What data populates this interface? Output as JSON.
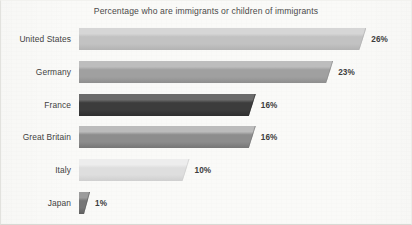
{
  "chart_data": {
    "type": "bar",
    "orientation": "horizontal",
    "title": "Percentage who are immigrants or children of immigrants",
    "xlabel": "",
    "ylabel": "",
    "xlim": [
      0,
      26
    ],
    "grid": false,
    "legend": null,
    "value_suffix": "%",
    "categories": [
      "United States",
      "Germany",
      "France",
      "Great Britain",
      "Italy",
      "Japan"
    ],
    "values": [
      26,
      23,
      16,
      16,
      10,
      1
    ],
    "value_labels": [
      "26%",
      "23%",
      "16%",
      "16%",
      "10%",
      "1%"
    ],
    "bars": [
      {
        "category": "United States",
        "value": 26,
        "value_label": "26%",
        "color_top": "#d6d6d6",
        "color_mid": "#c2c2c2",
        "color_bottom": "#b3b3b3",
        "color_bevel": "#a8a8a8"
      },
      {
        "category": "Germany",
        "value": 23,
        "value_label": "23%",
        "color_top": "#bdbdbd",
        "color_mid": "#a0a0a0",
        "color_bottom": "#8e8e8e",
        "color_bevel": "#7f7f7f"
      },
      {
        "category": "France",
        "value": 16,
        "value_label": "16%",
        "color_top": "#6b6b6b",
        "color_mid": "#3c3c3c",
        "color_bottom": "#2e2e2e",
        "color_bevel": "#242424"
      },
      {
        "category": "Great Britain",
        "value": 16,
        "value_label": "16%",
        "color_top": "#bcbcbc",
        "color_mid": "#8d8d8d",
        "color_bottom": "#767676",
        "color_bevel": "#6a6a6a"
      },
      {
        "category": "Italy",
        "value": 10,
        "value_label": "10%",
        "color_top": "#ededed",
        "color_mid": "#dedede",
        "color_bottom": "#cfcfcf",
        "color_bevel": "#c4c4c4"
      },
      {
        "category": "Japan",
        "value": 1,
        "value_label": "1%",
        "color_top": "#9c9c9c",
        "color_mid": "#767676",
        "color_bottom": "#5e5e5e",
        "color_bevel": "#545454"
      }
    ]
  },
  "colors": {
    "background": "#fafaf8",
    "title_text": "#4a4a4a",
    "category_text": "#3f3f3f",
    "value_text": "#3d3d3d",
    "frame_border": "#d9d9d4"
  }
}
